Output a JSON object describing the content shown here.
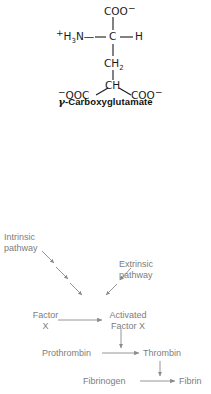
{
  "figure": {
    "background_color": "#ffffff",
    "structure_color": "#1a1a1a",
    "cascade_color": "#7d7d7d"
  },
  "structure": {
    "caption_gamma": "γ",
    "caption_text": "-Carboxyglutamate",
    "alpha_carboxyl": "COO",
    "alpha_carboxyl_charge": "−",
    "amino_charge": "+",
    "amino_h": "H",
    "amino_h_count": "3",
    "amino_n": "N—",
    "alpha_carbon": "C",
    "alpha_hydrogen": "H",
    "beta_carbon": "CH",
    "beta_carbon_count": "2",
    "gamma_carbon": "CH",
    "gamma_carboxyl_left_charge": "−",
    "gamma_carboxyl_left": "OOC",
    "gamma_carboxyl_right": "COO",
    "gamma_carboxyl_right_charge": "−"
  },
  "cascade": {
    "intrinsic_line1": "Intrinsic",
    "intrinsic_line2": "pathway",
    "extrinsic_line1": "Extrinsic",
    "extrinsic_line2": "pathway",
    "factor_x_line1": "Factor",
    "factor_x_line2": "X",
    "activated_line1": "Activated",
    "activated_line2": "Factor X",
    "prothrombin": "Prothrombin",
    "thrombin": "Thrombin",
    "fibrinogen": "Fibrinogen",
    "fibrin": "Fibrin"
  }
}
